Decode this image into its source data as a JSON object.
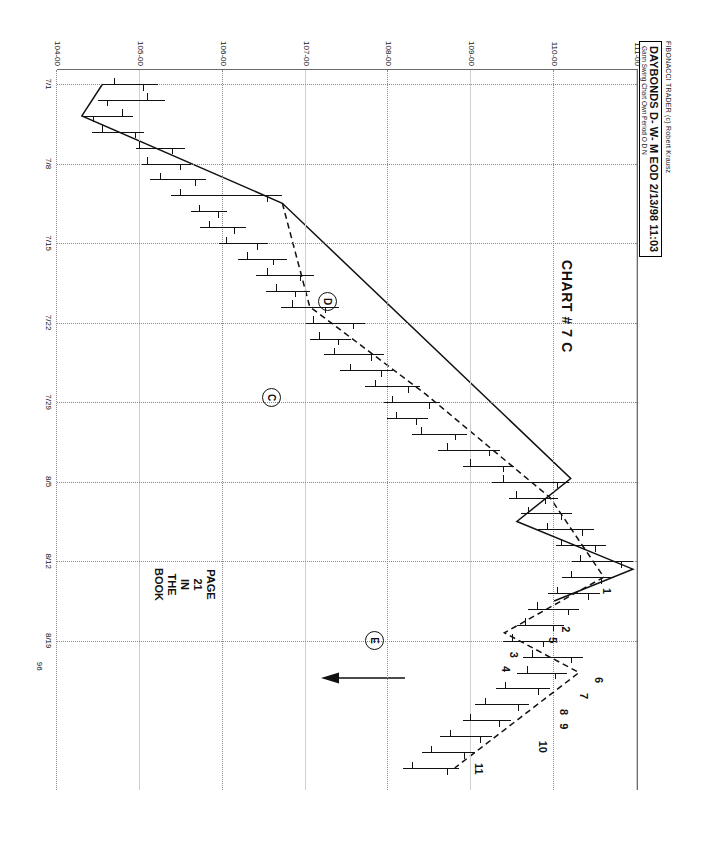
{
  "header": {
    "brand": "FIBONACCI TRADER (c) Robert Krausz",
    "symbol_line": "DAYBONDS D- W- M EOD  2/13/98 11:03",
    "study_line": "Gann Swing Chart Own Period O D N"
  },
  "annotations": {
    "title": "CHART # 7 C",
    "book_ref": {
      "l1": "PAGE",
      "l2": "21",
      "l3": "IN",
      "l4": "THE",
      "l5": "BOOK"
    },
    "circled": [
      {
        "label": "C",
        "x": 318,
        "y": 356
      },
      {
        "label": "D",
        "x": 222,
        "y": 300
      },
      {
        "label": "E",
        "x": 561,
        "y": 253
      }
    ],
    "point_numbers": [
      "1",
      "2",
      "3",
      "4",
      "5",
      "6",
      "7",
      "8",
      "9",
      "10",
      "11"
    ],
    "down_arrow": {
      "name": "down-arrow-marker"
    }
  },
  "chart_data": {
    "type": "bar",
    "subtype": "ohlc-bar-with-gann-swing-overlay",
    "title": "CHART # 7 C",
    "instrument": "DAYBONDS D- W- M EOD",
    "study": "Gann Swing Chart Own Period O D N",
    "xlabel": "",
    "ylabel": "",
    "year": "96",
    "grid": true,
    "legend": "none",
    "ylim": [
      104.0,
      111.0
    ],
    "ytick_labels": [
      "111-00",
      "110-00",
      "109-00",
      "108-00",
      "107-00",
      "106-00",
      "105-00",
      "104-00"
    ],
    "ytick_values": [
      111.0,
      110.0,
      109.0,
      108.0,
      107.0,
      106.0,
      105.0,
      104.0
    ],
    "xtick_labels": [
      "7/1",
      "7/8",
      "7/15",
      "7/22",
      "7/29",
      "8/5",
      "8/12",
      "8/19"
    ],
    "xtick_indices": [
      0,
      5,
      10,
      15,
      20,
      25,
      30,
      35
    ],
    "ohlc": [
      {
        "i": 0,
        "high": 105.22,
        "low": 104.55,
        "open": 104.7,
        "close": 105.05
      },
      {
        "i": 1,
        "high": 105.3,
        "low": 104.5,
        "open": 105.1,
        "close": 104.62
      },
      {
        "i": 2,
        "high": 104.92,
        "low": 104.3,
        "open": 104.8,
        "close": 104.45
      },
      {
        "i": 3,
        "high": 105.05,
        "low": 104.42,
        "open": 104.55,
        "close": 104.95
      },
      {
        "i": 4,
        "high": 105.55,
        "low": 104.95,
        "open": 105.0,
        "close": 105.4
      },
      {
        "i": 5,
        "high": 105.62,
        "low": 105.02,
        "open": 105.1,
        "close": 105.5
      },
      {
        "i": 6,
        "high": 105.8,
        "low": 105.12,
        "open": 105.25,
        "close": 105.68
      },
      {
        "i": 7,
        "high": 106.72,
        "low": 105.38,
        "open": 105.5,
        "close": 106.55
      },
      {
        "i": 8,
        "high": 106.05,
        "low": 105.62,
        "open": 105.72,
        "close": 105.95
      },
      {
        "i": 9,
        "high": 106.28,
        "low": 105.72,
        "open": 105.85,
        "close": 106.15
      },
      {
        "i": 10,
        "high": 106.55,
        "low": 105.95,
        "open": 106.05,
        "close": 106.42
      },
      {
        "i": 11,
        "high": 106.78,
        "low": 106.18,
        "open": 106.3,
        "close": 106.62
      },
      {
        "i": 12,
        "high": 107.1,
        "low": 106.4,
        "open": 106.55,
        "close": 106.95
      },
      {
        "i": 13,
        "high": 107.05,
        "low": 106.52,
        "open": 106.65,
        "close": 106.88
      },
      {
        "i": 14,
        "high": 107.4,
        "low": 106.7,
        "open": 106.85,
        "close": 107.25
      },
      {
        "i": 15,
        "high": 107.72,
        "low": 107.0,
        "open": 107.1,
        "close": 107.58
      },
      {
        "i": 16,
        "high": 107.55,
        "low": 107.05,
        "open": 107.18,
        "close": 107.4
      },
      {
        "i": 17,
        "high": 107.95,
        "low": 107.22,
        "open": 107.35,
        "close": 107.8
      },
      {
        "i": 18,
        "high": 108.05,
        "low": 107.42,
        "open": 107.55,
        "close": 107.92
      },
      {
        "i": 19,
        "high": 108.38,
        "low": 107.72,
        "open": 107.85,
        "close": 108.25
      },
      {
        "i": 20,
        "high": 108.62,
        "low": 107.95,
        "open": 108.05,
        "close": 108.5
      },
      {
        "i": 21,
        "high": 108.48,
        "low": 107.98,
        "open": 108.1,
        "close": 108.35
      },
      {
        "i": 22,
        "high": 108.95,
        "low": 108.28,
        "open": 108.4,
        "close": 108.82
      },
      {
        "i": 23,
        "high": 109.35,
        "low": 108.6,
        "open": 108.72,
        "close": 109.22
      },
      {
        "i": 24,
        "high": 109.52,
        "low": 108.9,
        "open": 109.0,
        "close": 109.4
      },
      {
        "i": 25,
        "high": 110.18,
        "low": 109.25,
        "open": 109.4,
        "close": 110.05
      },
      {
        "i": 26,
        "high": 110.05,
        "low": 109.45,
        "open": 109.55,
        "close": 109.9
      },
      {
        "i": 27,
        "high": 110.22,
        "low": 109.6,
        "open": 109.7,
        "close": 110.1
      },
      {
        "i": 28,
        "high": 110.48,
        "low": 109.8,
        "open": 109.92,
        "close": 110.35
      },
      {
        "i": 29,
        "high": 110.62,
        "low": 110.02,
        "open": 110.1,
        "close": 110.5
      },
      {
        "i": 30,
        "high": 110.95,
        "low": 110.22,
        "open": 110.32,
        "close": 110.82
      },
      {
        "i": 31,
        "high": 110.72,
        "low": 110.1,
        "open": 110.22,
        "close": 110.58
      },
      {
        "i": 32,
        "high": 110.55,
        "low": 109.92,
        "open": 110.05,
        "close": 110.42
      },
      {
        "i": 33,
        "high": 110.3,
        "low": 109.68,
        "open": 109.8,
        "close": 110.18
      },
      {
        "i": 34,
        "high": 110.12,
        "low": 109.55,
        "open": 109.66,
        "close": 110.0
      },
      {
        "i": 35,
        "high": 110.02,
        "low": 109.38,
        "open": 109.5,
        "close": 109.88
      },
      {
        "i": 36,
        "high": 110.35,
        "low": 109.62,
        "open": 109.75,
        "close": 110.22
      },
      {
        "i": 37,
        "high": 110.15,
        "low": 109.55,
        "open": 109.68,
        "close": 110.02
      },
      {
        "i": 38,
        "high": 109.95,
        "low": 109.3,
        "open": 109.42,
        "close": 109.82
      },
      {
        "i": 39,
        "high": 109.7,
        "low": 109.05,
        "open": 109.18,
        "close": 109.58
      },
      {
        "i": 40,
        "high": 109.48,
        "low": 108.9,
        "open": 109.0,
        "close": 109.35
      },
      {
        "i": 41,
        "high": 109.25,
        "low": 108.62,
        "open": 108.75,
        "close": 109.12
      },
      {
        "i": 42,
        "high": 109.05,
        "low": 108.4,
        "open": 108.52,
        "close": 108.92
      },
      {
        "i": 43,
        "high": 108.85,
        "low": 108.18,
        "open": 108.3,
        "close": 108.72
      }
    ],
    "gann_swing_up": [
      {
        "i": 0.0,
        "p": 104.55
      },
      {
        "i": 2.0,
        "p": 104.3
      },
      {
        "i": 7.5,
        "p": 106.72
      },
      {
        "i": 24.8,
        "p": 110.2
      },
      {
        "i": 27.5,
        "p": 109.55
      },
      {
        "i": 30.5,
        "p": 110.95
      },
      {
        "i": 32.5,
        "p": 110.0
      }
    ],
    "gann_swing_down": [
      {
        "i": 7.5,
        "p": 106.72
      },
      {
        "i": 14.0,
        "p": 107.05
      },
      {
        "i": 19.5,
        "p": 108.45
      },
      {
        "i": 26.0,
        "p": 109.95
      },
      {
        "i": 31.0,
        "p": 110.6
      },
      {
        "i": 34.5,
        "p": 109.4
      },
      {
        "i": 37.0,
        "p": 110.3
      },
      {
        "i": 43.0,
        "p": 108.8
      }
    ],
    "labeled_swing_points": [
      {
        "n": "1",
        "i": 32.0,
        "p": 110.4
      },
      {
        "n": "2",
        "i": 34.4,
        "p": 109.9
      },
      {
        "n": "3",
        "i": 36.0,
        "p": 109.28
      },
      {
        "n": "4",
        "i": 36.9,
        "p": 109.18
      },
      {
        "n": "5",
        "i": 35.1,
        "p": 109.75
      },
      {
        "n": "6",
        "i": 37.6,
        "p": 110.3
      },
      {
        "n": "7",
        "i": 38.6,
        "p": 110.12
      },
      {
        "n": "8",
        "i": 39.6,
        "p": 109.88
      },
      {
        "n": "9",
        "i": 40.5,
        "p": 109.88
      },
      {
        "n": "10",
        "i": 41.6,
        "p": 109.62
      },
      {
        "n": "11",
        "i": 43.0,
        "p": 108.85
      }
    ]
  }
}
